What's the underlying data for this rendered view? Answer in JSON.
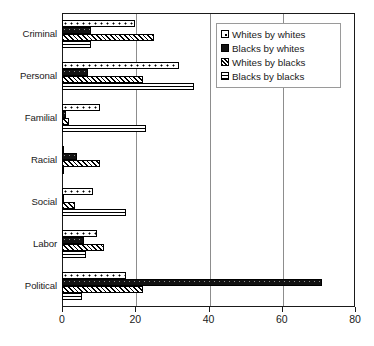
{
  "chart_data": {
    "type": "bar",
    "orientation": "horizontal",
    "title": "",
    "subtitle": "",
    "xlabel": "",
    "ylabel": "",
    "xlim": [
      0,
      80
    ],
    "xticks": [
      0,
      20,
      40,
      60,
      80
    ],
    "xticklabels": [
      "0",
      "20",
      "40",
      "60",
      "80"
    ],
    "grid": "vertical-at-xticks",
    "legend_position": "top-right-inside",
    "categories": [
      "Criminal",
      "Personal",
      "Familial",
      "Racial",
      "Social",
      "Labor",
      "Political"
    ],
    "series": [
      {
        "name": "Whites by whites",
        "pattern": "white-with-dots",
        "values": [
          20,
          32,
          10.5,
          0.5,
          8.5,
          9.5,
          17.5
        ]
      },
      {
        "name": "Blacks by whites",
        "pattern": "solid-black",
        "values": [
          8,
          7,
          1,
          4,
          0.5,
          6,
          71
        ]
      },
      {
        "name": "Whites by blacks",
        "pattern": "diagonal-hatch",
        "values": [
          25,
          22,
          2,
          10.5,
          3.5,
          11.5,
          22
        ]
      },
      {
        "name": "Blacks by blacks",
        "pattern": "horizontal-lines",
        "values": [
          8,
          36,
          23,
          0.5,
          17.5,
          6.5,
          5.5
        ]
      }
    ]
  },
  "legend": {
    "items": [
      {
        "label": "Whites by whites"
      },
      {
        "label": "Blacks by whites"
      },
      {
        "label": "Whites by blacks"
      },
      {
        "label": "Blacks by blacks"
      }
    ]
  },
  "colors": {
    "axis": "#1a1a1a",
    "gridline": "#8d8d8d",
    "bar_outline": "#000000",
    "bar_fill": "#ffffff",
    "solid_series": "#121212",
    "background": "#ffffff",
    "legend_border": "#9a9a9a"
  }
}
